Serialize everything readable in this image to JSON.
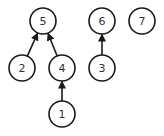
{
  "diagram": {
    "type": "disjoint-set-forest",
    "nodes": [
      {
        "id": "5",
        "label": "5",
        "x": 43,
        "y": 21
      },
      {
        "id": "6",
        "label": "6",
        "x": 102,
        "y": 21
      },
      {
        "id": "7",
        "label": "7",
        "x": 142,
        "y": 21
      },
      {
        "id": "2",
        "label": "2",
        "x": 22,
        "y": 68
      },
      {
        "id": "4",
        "label": "4",
        "x": 62,
        "y": 68
      },
      {
        "id": "3",
        "label": "3",
        "x": 102,
        "y": 68
      },
      {
        "id": "1",
        "label": "1",
        "x": 62,
        "y": 114
      }
    ],
    "edges": [
      {
        "from": "2",
        "to": "5"
      },
      {
        "from": "4",
        "to": "5"
      },
      {
        "from": "3",
        "to": "6"
      },
      {
        "from": "1",
        "to": "4"
      }
    ],
    "node_radius": 13,
    "colors": {
      "stroke": "#1a1a1a",
      "fill": "#ffffff",
      "text": "#333333"
    }
  }
}
